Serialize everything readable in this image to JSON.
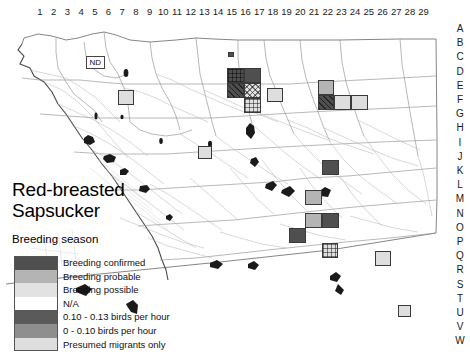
{
  "figure": {
    "title": "Red-breasted\nSapsucker",
    "subtitle": "Breeding season",
    "inset_label": "ND"
  },
  "axes": {
    "columns": [
      "1",
      "2",
      "3",
      "4",
      "5",
      "6",
      "7",
      "8",
      "9",
      "10",
      "11",
      "12",
      "13",
      "14",
      "15",
      "16",
      "17",
      "18",
      "19",
      "20",
      "21",
      "22",
      "23",
      "24",
      "25",
      "26",
      "27",
      "28",
      "29"
    ],
    "rows": [
      "A",
      "B",
      "C",
      "D",
      "E",
      "F",
      "G",
      "H",
      "I",
      "J",
      "K",
      "L",
      "M",
      "N",
      "O",
      "P",
      "Q",
      "R",
      "S",
      "T",
      "U",
      "V",
      "W"
    ]
  },
  "legend": {
    "entries": [
      {
        "label": "Breeding confirmed",
        "key": "confirmed",
        "color": "#4f4f4f"
      },
      {
        "label": "Breeding probable",
        "key": "probable",
        "color": "#b4b4b4"
      },
      {
        "label": "Breeding possible",
        "key": "possible",
        "color": "#e2e2e2"
      },
      {
        "label": "N/A",
        "key": "na",
        "color": "#ffffff"
      },
      {
        "label": "0.10 - 0.13 birds per hour",
        "key": "high",
        "color": "#5a5a5a"
      },
      {
        "label": "0 - 0.10 birds per hour",
        "key": "low",
        "color": "#8e8e8e"
      },
      {
        "label": "Presumed migrants only",
        "key": "migrant",
        "color": "#dedede"
      }
    ]
  },
  "chart_data": {
    "type": "heatmap",
    "xlabel": "",
    "ylabel": "",
    "grid": true,
    "legend_position": "lower-left",
    "x_ticks": [
      "1",
      "2",
      "3",
      "4",
      "5",
      "6",
      "7",
      "8",
      "9",
      "10",
      "11",
      "12",
      "13",
      "14",
      "15",
      "16",
      "17",
      "18",
      "19",
      "20",
      "21",
      "22",
      "23",
      "24",
      "25",
      "26",
      "27",
      "28",
      "29"
    ],
    "y_ticks": [
      "A",
      "B",
      "C",
      "D",
      "E",
      "F",
      "G",
      "H",
      "I",
      "J",
      "K",
      "L",
      "M",
      "N",
      "O",
      "P",
      "Q",
      "R",
      "S",
      "T",
      "U",
      "V",
      "W"
    ],
    "categories": [
      "Breeding confirmed",
      "Breeding probable",
      "Breeding possible",
      "N/A",
      "0.10 - 0.13 birds per hour",
      "0 - 0.10 birds per hour",
      "Presumed migrants only"
    ],
    "cells": [
      {
        "col": 13,
        "row": "A",
        "value": "confirmed",
        "hatch": "none",
        "x": 228,
        "y": 34,
        "w": 6,
        "h": 5
      },
      {
        "col": 7,
        "row": "E",
        "value": "migrant",
        "hatch": "none",
        "x": 118,
        "y": 72,
        "w": 16,
        "h": 15
      },
      {
        "col": 14,
        "row": "D",
        "value": "confirmed",
        "hatch": "grid",
        "x": 227,
        "y": 50,
        "w": 17,
        "h": 15
      },
      {
        "col": 15,
        "row": "D",
        "value": "confirmed",
        "hatch": "none",
        "x": 244,
        "y": 50,
        "w": 17,
        "h": 15
      },
      {
        "col": 14,
        "row": "E",
        "value": "confirmed",
        "hatch": "diag",
        "x": 227,
        "y": 65,
        "w": 17,
        "h": 15
      },
      {
        "col": 15,
        "row": "E",
        "value": "possible",
        "hatch": "cross",
        "x": 244,
        "y": 65,
        "w": 17,
        "h": 15
      },
      {
        "col": 15,
        "row": "F",
        "value": "possible",
        "hatch": "grid",
        "x": 244,
        "y": 80,
        "w": 17,
        "h": 15
      },
      {
        "col": 18,
        "row": "E",
        "value": "migrant",
        "hatch": "none",
        "x": 267,
        "y": 70,
        "w": 16,
        "h": 14
      },
      {
        "col": 21,
        "row": "E",
        "value": "probable",
        "hatch": "none",
        "x": 318,
        "y": 62,
        "w": 16,
        "h": 15
      },
      {
        "col": 21,
        "row": "F",
        "value": "confirmed",
        "hatch": "diag",
        "x": 318,
        "y": 77,
        "w": 16,
        "h": 15
      },
      {
        "col": 22,
        "row": "F",
        "value": "migrant",
        "hatch": "none",
        "x": 334,
        "y": 77,
        "w": 17,
        "h": 15
      },
      {
        "col": 23,
        "row": "F",
        "value": "migrant",
        "hatch": "none",
        "x": 351,
        "y": 77,
        "w": 17,
        "h": 15
      },
      {
        "col": 12,
        "row": "I",
        "value": "migrant",
        "hatch": "none",
        "x": 198,
        "y": 128,
        "w": 14,
        "h": 13
      },
      {
        "col": 20,
        "row": "K",
        "value": "confirmed",
        "hatch": "none",
        "x": 322,
        "y": 142,
        "w": 17,
        "h": 15
      },
      {
        "col": 20,
        "row": "M",
        "value": "probable",
        "hatch": "none",
        "x": 305,
        "y": 172,
        "w": 17,
        "h": 15
      },
      {
        "col": 20,
        "row": "N",
        "value": "probable",
        "hatch": "none",
        "x": 305,
        "y": 195,
        "w": 17,
        "h": 15
      },
      {
        "col": 21,
        "row": "N",
        "value": "confirmed",
        "hatch": "none",
        "x": 322,
        "y": 195,
        "w": 17,
        "h": 15
      },
      {
        "col": 19,
        "row": "O",
        "value": "confirmed",
        "hatch": "none",
        "x": 289,
        "y": 210,
        "w": 17,
        "h": 15
      },
      {
        "col": 21,
        "row": "P",
        "value": "migrant",
        "hatch": "grid",
        "x": 322,
        "y": 225,
        "w": 16,
        "h": 15
      },
      {
        "col": 24,
        "row": "Q",
        "value": "migrant",
        "hatch": "none",
        "x": 375,
        "y": 233,
        "w": 16,
        "h": 15
      },
      {
        "col": 26,
        "row": "T",
        "value": "migrant",
        "hatch": "none",
        "x": 398,
        "y": 287,
        "w": 13,
        "h": 12
      }
    ]
  }
}
